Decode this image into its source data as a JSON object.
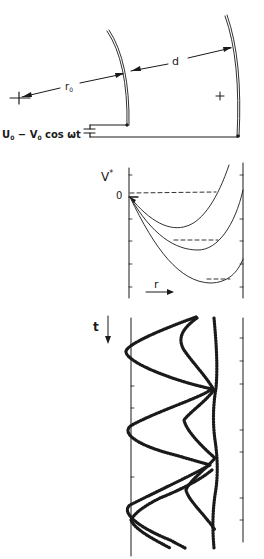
{
  "figure": {
    "ink_color": "#1a1a1a",
    "background": "#ffffff",
    "electrodes": {
      "radius_label": "r",
      "radius_subscript": "0",
      "gap_label": "d",
      "polarity_label": "+",
      "voltage_label": {
        "U": "U",
        "U_sub": "0",
        "minus": " − ",
        "V": "V",
        "V_sub": "0",
        "tail": " cos ωt"
      }
    },
    "potential_plot": {
      "ylabel": "V",
      "ylabel_sup": "*",
      "zero_label": "0",
      "xlabel": "r"
    },
    "trajectory_plot": {
      "ylabel": "t"
    }
  }
}
